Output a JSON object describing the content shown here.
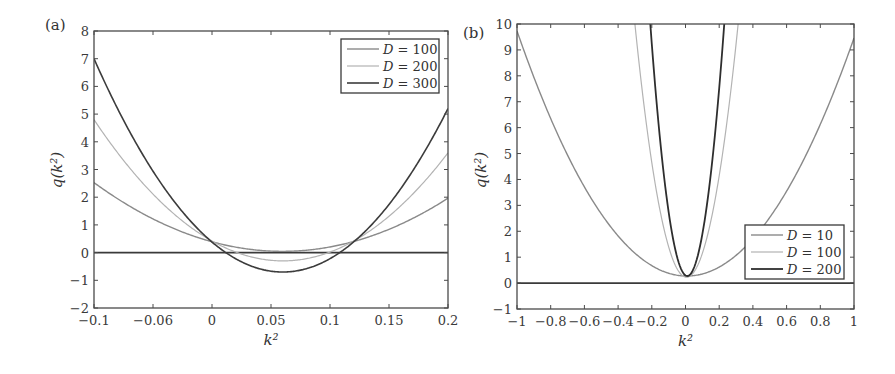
{
  "chart_data": [
    {
      "panel": "(a)",
      "type": "line",
      "title": "",
      "xlabel": "k²",
      "ylabel": "q(k²)",
      "xlim": [
        -0.1,
        0.2
      ],
      "ylim": [
        -2,
        8
      ],
      "grid": false,
      "legend_position": "upper right",
      "x_ticks": [
        -0.1,
        -0.05,
        0,
        0.05,
        0.1,
        0.15,
        0.2
      ],
      "x_tick_labels": [
        "−0.1",
        "−0.06",
        "0",
        "0.05",
        "0.1",
        "0.15",
        "0.2"
      ],
      "y_ticks": [
        -2,
        -1,
        0,
        1,
        2,
        3,
        4,
        5,
        6,
        7,
        8
      ],
      "y_tick_labels": [
        "−2",
        "−1",
        "0",
        "1",
        "2",
        "3",
        "4",
        "5",
        "6",
        "7",
        "8"
      ],
      "reference_line": {
        "y": 0
      },
      "series": [
        {
          "name": "D = 100",
          "color": "#8a8a8a",
          "width": 1.4,
          "x": [
            -0.1,
            -0.05,
            0,
            0.03,
            0.06,
            0.09,
            0.12,
            0.15,
            0.2
          ],
          "values": [
            2.55,
            1.17,
            0.4,
            0.14,
            0.05,
            0.14,
            0.4,
            0.84,
            1.96
          ]
        },
        {
          "name": "D = 200",
          "color": "#b3b3b3",
          "width": 1.2,
          "x": [
            -0.1,
            -0.05,
            0,
            0.03,
            0.06,
            0.09,
            0.12,
            0.15,
            0.2
          ],
          "values": [
            4.8,
            2.11,
            0.42,
            -0.12,
            -0.3,
            -0.12,
            0.42,
            1.31,
            3.6
          ]
        },
        {
          "name": "D = 300",
          "color": "#3c3c3c",
          "width": 1.6,
          "x": [
            -0.1,
            -0.05,
            0,
            0.03,
            0.06,
            0.09,
            0.12,
            0.15,
            0.2
          ],
          "values": [
            7.0,
            2.94,
            0.38,
            -0.43,
            -0.7,
            -0.43,
            0.38,
            1.74,
            5.2
          ]
        }
      ]
    },
    {
      "panel": "(b)",
      "type": "line",
      "title": "",
      "xlabel": "k²",
      "ylabel": "q(k²)",
      "xlim": [
        -1,
        1
      ],
      "ylim": [
        -1,
        10
      ],
      "grid": false,
      "legend_position": "lower right",
      "x_ticks": [
        -1,
        -0.8,
        -0.6,
        -0.4,
        -0.2,
        0,
        0.2,
        0.4,
        0.6,
        0.8,
        1
      ],
      "x_tick_labels": [
        "−1",
        "−0.8",
        "−0.6",
        "−0.4",
        "−0.2",
        "0",
        "0.2",
        "0.4",
        "0.6",
        "0.8",
        "1"
      ],
      "y_ticks": [
        -1,
        0,
        1,
        2,
        3,
        4,
        5,
        6,
        7,
        8,
        9,
        10
      ],
      "y_tick_labels": [
        "−1",
        "0",
        "1",
        "2",
        "3",
        "4",
        "5",
        "6",
        "7",
        "8",
        "9",
        "10"
      ],
      "reference_line": {
        "y": 0
      },
      "series": [
        {
          "name": "D = 10",
          "color": "#8a8a8a",
          "width": 1.4,
          "x": [
            -1,
            -0.8,
            -0.6,
            -0.4,
            -0.2,
            0,
            0.2,
            0.4,
            0.6,
            0.8,
            1
          ],
          "values": [
            9.7,
            6.4,
            3.7,
            1.8,
            0.68,
            0.3,
            0.64,
            1.7,
            3.5,
            6.1,
            9.5
          ]
        },
        {
          "name": "D = 100",
          "color": "#b3b3b3",
          "width": 1.2,
          "x": [
            -0.3,
            -0.2,
            -0.1,
            0,
            0.1,
            0.2,
            0.31
          ],
          "values": [
            9.9,
            4.7,
            1.5,
            0.3,
            1.1,
            3.9,
            10.0
          ]
        },
        {
          "name": "D = 200",
          "color": "#2e2e2e",
          "width": 1.8,
          "x": [
            -0.21,
            -0.15,
            -0.1,
            -0.05,
            0,
            0.05,
            0.1,
            0.15,
            0.23
          ],
          "values": [
            10.0,
            5.7,
            2.7,
            0.9,
            0.3,
            0.6,
            1.9,
            4.2,
            10.0
          ]
        }
      ]
    }
  ],
  "figure": {
    "panel_a_label": "(a)",
    "panel_b_label": "(b)"
  }
}
